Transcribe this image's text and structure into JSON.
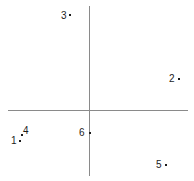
{
  "figure": {
    "background_color": "#ffffff",
    "axis_color": "#8a8a8a",
    "label_color": "#1c1c1c",
    "point_color": "#1c1c1c",
    "width": 194,
    "height": 181
  },
  "axes": {
    "vertical": {
      "name": "y-axis",
      "x": 89,
      "y_start": 6,
      "y_end": 176
    },
    "horizontal": {
      "name": "x-axis",
      "y": 110,
      "x_start": 8,
      "x_end": 188
    },
    "origin": {
      "x": 89,
      "y": 110
    }
  },
  "chart_data": {
    "type": "scatter",
    "title": "",
    "xlabel": "",
    "ylabel": "",
    "grid": false,
    "legend": "none",
    "axis_style": "cross-through-origin",
    "origin_px": {
      "x": 89,
      "y": 110
    },
    "points": [
      {
        "label": "1",
        "dot_px": {
          "x": 19,
          "y": 140
        },
        "label_px": {
          "x": 11,
          "y": 136
        },
        "quadrant": "III",
        "label_position": "left"
      },
      {
        "label": "2",
        "dot_px": {
          "x": 178,
          "y": 78
        },
        "label_px": {
          "x": 169,
          "y": 74
        },
        "quadrant": "I",
        "label_position": "left"
      },
      {
        "label": "3",
        "dot_px": {
          "x": 69,
          "y": 14
        },
        "label_px": {
          "x": 61,
          "y": 11
        },
        "quadrant": "II",
        "label_position": "left"
      },
      {
        "label": "4",
        "dot_px": {
          "x": 21,
          "y": 134
        },
        "label_px": {
          "x": 23,
          "y": 126
        },
        "quadrant": "III",
        "label_position": "upper-right"
      },
      {
        "label": "5",
        "dot_px": {
          "x": 165,
          "y": 164
        },
        "label_px": {
          "x": 156,
          "y": 160
        },
        "quadrant": "IV",
        "label_position": "left"
      },
      {
        "label": "6",
        "dot_px": {
          "x": 89,
          "y": 132
        },
        "label_px": {
          "x": 79,
          "y": 128
        },
        "quadrant": "on-y-axis",
        "label_position": "left"
      }
    ]
  }
}
